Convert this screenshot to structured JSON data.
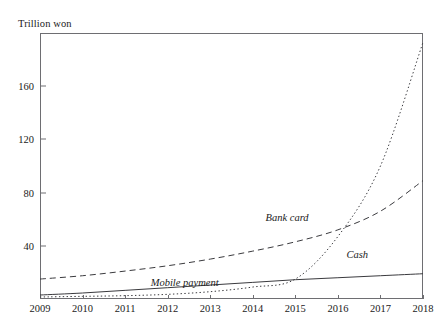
{
  "chart_data": {
    "type": "line",
    "title": "",
    "ylabel": "Trillion won",
    "xlabel": "",
    "x": [
      2009,
      2010,
      2011,
      2012,
      2013,
      2014,
      2015,
      2016,
      2017,
      2018
    ],
    "xlim": [
      2009,
      2018
    ],
    "ylim": [
      0,
      200
    ],
    "yticks": [
      40,
      80,
      120,
      160
    ],
    "xticks": [
      2009,
      2010,
      2011,
      2012,
      2013,
      2014,
      2015,
      2016,
      2017,
      2018
    ],
    "grid": false,
    "legend": "inline-annotations",
    "series": [
      {
        "name": "Bank card",
        "style": "dashed",
        "values": [
          15,
          17.5,
          21,
          25,
          30,
          36,
          43,
          52,
          66,
          89
        ]
      },
      {
        "name": "Mobile payment",
        "style": "dotted",
        "values": [
          1.5,
          2,
          2.5,
          3.5,
          5.5,
          9,
          15,
          47,
          100,
          193
        ]
      },
      {
        "name": "Cash",
        "style": "solid",
        "values": [
          3,
          4.5,
          6.5,
          8.5,
          10.5,
          12.5,
          14.5,
          16,
          17.5,
          19
        ]
      }
    ],
    "annotations": [
      {
        "text": "Bank card",
        "x": 2014.3,
        "y": 60
      },
      {
        "text": "Mobile payment",
        "x": 2011.6,
        "y": 11
      },
      {
        "text": "Cash",
        "x": 2016.2,
        "y": 32
      }
    ]
  },
  "axis": {
    "y_title": "Trillion won",
    "y_tick_labels": [
      "160",
      "120",
      "80",
      "40"
    ],
    "x_tick_labels": [
      "2009",
      "2010",
      "2011",
      "2012",
      "2013",
      "2014",
      "2015",
      "2016",
      "2017",
      "2018"
    ]
  },
  "labels": {
    "bank_card": "Bank card",
    "mobile_payment": "Mobile payment",
    "cash": "Cash"
  },
  "colors": {
    "ink": "#1a1a1a",
    "frame": "#6e6e72",
    "series": "#3a3a3e"
  }
}
